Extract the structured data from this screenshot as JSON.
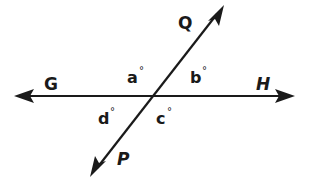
{
  "diagram": {
    "type": "intersecting-lines",
    "colors": {
      "line": "#1a1a1a",
      "background": "#ffffff"
    },
    "lines": [
      {
        "name": "GH",
        "endpoints": [
          "G",
          "H"
        ],
        "direction": "horizontal",
        "arrows": "both"
      },
      {
        "name": "PQ",
        "endpoints": [
          "P",
          "Q"
        ],
        "direction": "oblique",
        "arrows": "both"
      }
    ],
    "points": {
      "G": "G",
      "H": "H",
      "P": "P",
      "Q": "Q"
    },
    "angles": {
      "a": "a",
      "b": "b",
      "c": "c",
      "d": "d"
    },
    "degree_symbol": "°"
  }
}
